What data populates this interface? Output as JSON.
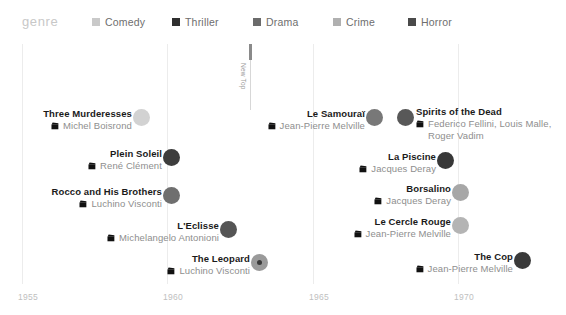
{
  "legend": {
    "title": "genre",
    "items": [
      {
        "label": "Comedy",
        "color": "#c9c9c9",
        "x": 92
      },
      {
        "label": "Thriller",
        "color": "#2f2f2f",
        "x": 172
      },
      {
        "label": "Drama",
        "color": "#6b6b6b",
        "x": 253
      },
      {
        "label": "Crime",
        "color": "#b0b0b0",
        "x": 333
      },
      {
        "label": "Horror",
        "color": "#4a4a4a",
        "x": 408
      }
    ]
  },
  "axis": {
    "ticks": [
      {
        "label": "1955",
        "x": 18
      },
      {
        "label": "1960",
        "x": 163
      },
      {
        "label": "1965",
        "x": 309
      },
      {
        "label": "1970",
        "x": 454
      }
    ],
    "gridlines": [
      22,
      167,
      313,
      458
    ]
  },
  "marker": {
    "label": "New Top",
    "x": 250,
    "top": 4,
    "cap_height": 16,
    "line_height": 50
  },
  "chart_data": {
    "type": "scatter",
    "title": "genre",
    "xlabel": "",
    "ylabel": "",
    "xlim": [
      1955,
      1971
    ],
    "grid": true,
    "legend_position": "top",
    "categories": [
      "Comedy",
      "Thriller",
      "Drama",
      "Crime",
      "Horror"
    ],
    "points": [
      {
        "title": "Three Murderesses",
        "director": "Michel Boisrond",
        "year": 1959,
        "genre": "Comedy"
      },
      {
        "title": "Plein Soleil",
        "director": "René Clément",
        "year": 1960,
        "genre": "Thriller"
      },
      {
        "title": "Rocco and His Brothers",
        "director": "Luchino Visconti",
        "year": 1960,
        "genre": "Drama"
      },
      {
        "title": "L'Eclisse",
        "director": "Michelangelo Antonioni",
        "year": 1962,
        "genre": "Drama"
      },
      {
        "title": "The Leopard",
        "director": "Luchino Visconti",
        "year": 1963,
        "genre": "Drama"
      },
      {
        "title": "Le Samouraï",
        "director": "Jean-Pierre Melville",
        "year": 1967,
        "genre": "Drama"
      },
      {
        "title": "Spirits of the Dead",
        "director": "Federico Fellini, Louis Malle,\nRoger Vadim",
        "year": 1968,
        "genre": "Horror"
      },
      {
        "title": "La Piscine",
        "director": "Jacques Deray",
        "year": 1969,
        "genre": "Thriller"
      },
      {
        "title": "Borsalino",
        "director": "Jacques Deray",
        "year": 1970,
        "genre": "Crime"
      },
      {
        "title": "Le Cercle Rouge",
        "director": "Jean-Pierre Melville",
        "year": 1970,
        "genre": "Crime"
      },
      {
        "title": "The Cop",
        "director": "Jean-Pierre Melville",
        "year": 1970,
        "genre": "Thriller"
      }
    ]
  },
  "films": [
    {
      "title": "Three Murderesses",
      "director": "Michel Boisrond",
      "label_side": "left",
      "text_right": 132,
      "text_top": 68,
      "dot_x": 133,
      "dot_y": 69,
      "dot_size": 17,
      "color": "#d2d2d2"
    },
    {
      "title": "Plein Soleil",
      "director": "René Clément",
      "label_side": "left",
      "text_right": 162,
      "text_top": 108,
      "dot_x": 163,
      "dot_y": 109,
      "dot_size": 17,
      "color": "#3d3d3d"
    },
    {
      "title": "Rocco and His Brothers",
      "director": "Luchino Visconti",
      "label_side": "left",
      "text_right": 162,
      "text_top": 146,
      "dot_x": 163,
      "dot_y": 147,
      "dot_size": 17,
      "color": "#6f6f6f"
    },
    {
      "title": "L'Eclisse",
      "director": "Michelangelo Antonioni",
      "label_side": "left",
      "text_right": 219,
      "text_top": 180,
      "dot_x": 220,
      "dot_y": 181,
      "dot_size": 17,
      "color": "#555555"
    },
    {
      "title": "The Leopard",
      "director": "Luchino Visconti",
      "label_side": "left",
      "text_right": 250,
      "text_top": 213,
      "dot_x": 251,
      "dot_y": 214,
      "dot_size": 17,
      "color": "#9a9a9a",
      "inner_color": "#3a3a3a",
      "inner_size": 5
    },
    {
      "title": "Le Samouraï",
      "director": "Jean-Pierre Melville",
      "label_side": "left",
      "text_right": 365,
      "text_top": 68,
      "dot_x": 366,
      "dot_y": 69,
      "dot_size": 17,
      "color": "#787878"
    },
    {
      "title": "Spirits of the Dead",
      "director": "Federico Fellini, Louis Malle,\nRoger Vadim",
      "label_side": "right",
      "text_right": 416,
      "text_top": 66,
      "dot_x": 397,
      "dot_y": 69,
      "dot_size": 17,
      "color": "#585858"
    },
    {
      "title": "La Piscine",
      "director": "Jacques Deray",
      "label_side": "left",
      "text_right": 436,
      "text_top": 111,
      "dot_x": 437,
      "dot_y": 112,
      "dot_size": 17,
      "color": "#383838"
    },
    {
      "title": "Borsalino",
      "director": "Jacques Deray",
      "label_side": "left",
      "text_right": 451,
      "text_top": 143,
      "dot_x": 452,
      "dot_y": 144,
      "dot_size": 17,
      "color": "#a7a7a7"
    },
    {
      "title": "Le Cercle Rouge",
      "director": "Jean-Pierre Melville",
      "label_side": "left",
      "text_right": 451,
      "text_top": 176,
      "dot_x": 452,
      "dot_y": 177,
      "dot_size": 17,
      "color": "#b4b4b4"
    },
    {
      "title": "The Cop",
      "director": "Jean-Pierre Melville",
      "label_side": "left",
      "text_right": 513,
      "text_top": 211,
      "dot_x": 514,
      "dot_y": 212,
      "dot_size": 17,
      "color": "#3a3a3a"
    }
  ]
}
